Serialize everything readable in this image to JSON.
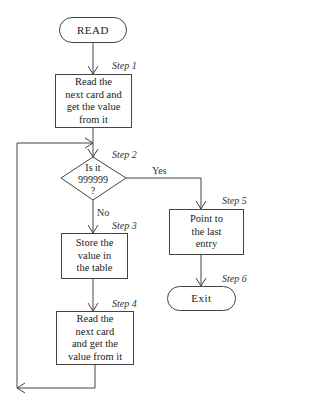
{
  "flowchart": {
    "start": {
      "label": "READ"
    },
    "step1": {
      "step": "Step 1",
      "label": "Read the\nnext card and\nget the value\nfrom it"
    },
    "step2": {
      "step": "Step 2",
      "label": "Is it\n999999\n?",
      "yes": "Yes",
      "no": "No"
    },
    "step3": {
      "step": "Step 3",
      "label": "Store the\nvalue in\nthe table"
    },
    "step4": {
      "step": "Step 4",
      "label": "Read the\nnext card\nand get the\nvalue from it"
    },
    "step5": {
      "step": "Step 5",
      "label": "Point to\nthe last\nentry"
    },
    "step6": {
      "step": "Step 6",
      "label": "Exit"
    }
  },
  "colors": {
    "line": "#444444",
    "background": "#ffffff"
  }
}
